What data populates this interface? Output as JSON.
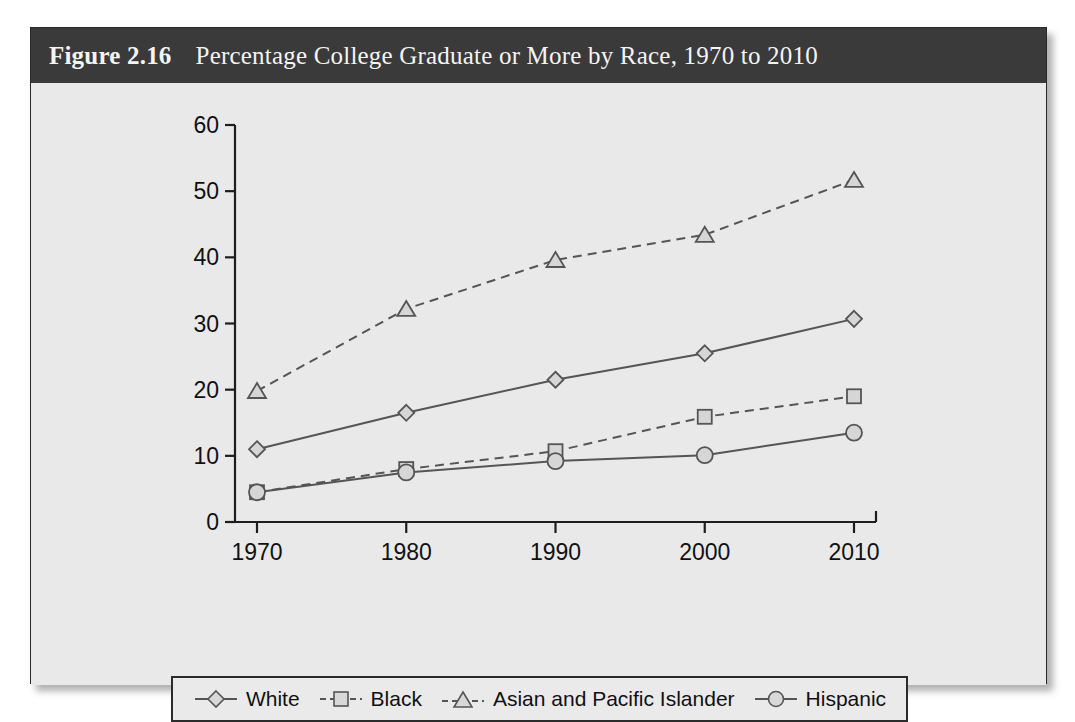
{
  "figure": {
    "number_label": "Figure 2.16",
    "title": "Percentage College Graduate or More by Race, 1970 to 2010",
    "header_bg": "#3a3a3a",
    "header_text_color": "#f4f4f4",
    "panel_bg": "#e9e9e9",
    "border_color": "#2a2a2a"
  },
  "legend": {
    "items": [
      {
        "label": "White",
        "marker": "diamond-marker-icon",
        "dash": "solid"
      },
      {
        "label": "Black",
        "marker": "square-marker-icon",
        "dash": "dashed"
      },
      {
        "label": "Asian and Pacific Islander",
        "marker": "triangle-marker-icon",
        "dash": "dashed"
      },
      {
        "label": "Hispanic",
        "marker": "circle-marker-icon",
        "dash": "solid"
      }
    ]
  },
  "axes": {
    "y_ticks": [
      "0",
      "10",
      "20",
      "30",
      "40",
      "50",
      "60"
    ],
    "x_ticks": [
      "1970",
      "1980",
      "1990",
      "2000",
      "2010"
    ]
  },
  "chart_data": {
    "type": "line",
    "title": "Percentage College Graduate or More by Race, 1970 to 2010",
    "xlabel": "",
    "ylabel": "",
    "x": [
      1970,
      1980,
      1990,
      2000,
      2010
    ],
    "categories": [
      "1970",
      "1980",
      "1990",
      "2000",
      "2010"
    ],
    "xlim": [
      1965,
      2015
    ],
    "ylim": [
      0,
      60
    ],
    "ytick_step": 10,
    "grid": false,
    "legend_position": "bottom",
    "series": [
      {
        "name": "White",
        "marker": "diamond",
        "linestyle": "solid",
        "color": "#555555",
        "values": [
          11.0,
          16.5,
          21.5,
          25.5,
          30.7
        ]
      },
      {
        "name": "Black",
        "marker": "square",
        "linestyle": "dashed",
        "color": "#555555",
        "values": [
          4.5,
          8.0,
          10.7,
          15.9,
          19.0
        ]
      },
      {
        "name": "Asian and Pacific Islander",
        "marker": "triangle",
        "linestyle": "dashed",
        "color": "#555555",
        "values": [
          19.8,
          32.2,
          39.6,
          43.4,
          51.7
        ]
      },
      {
        "name": "Hispanic",
        "marker": "circle",
        "linestyle": "solid",
        "color": "#555555",
        "values": [
          4.5,
          7.5,
          9.2,
          10.1,
          13.5
        ]
      }
    ]
  }
}
